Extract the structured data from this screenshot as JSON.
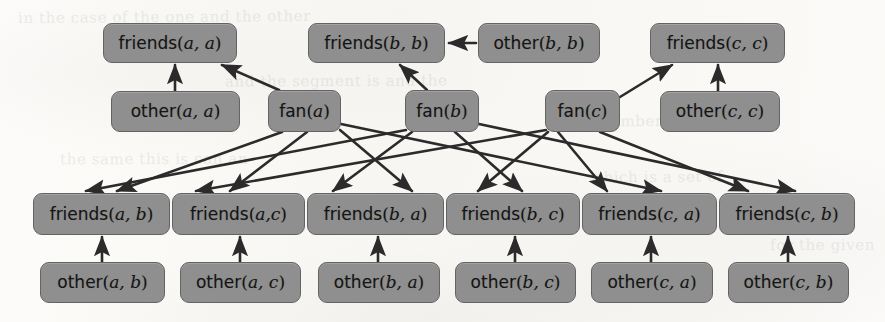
{
  "figure": {
    "colors": {
      "node_fill": "#8f8f8f",
      "node_border": "#636363",
      "edge": "#2b2b2b",
      "paper": "#faf9f7",
      "text": "#141414"
    },
    "constants": [
      "a",
      "b",
      "c"
    ],
    "predicates": [
      "friends",
      "other",
      "fan"
    ]
  },
  "nodes": [
    {
      "id": "friends_aa",
      "predicate": "friends",
      "args": "a, a",
      "label": "friends(a, a)",
      "x": 103,
      "y": 23,
      "w": 134,
      "h": 40
    },
    {
      "id": "friends_bb",
      "predicate": "friends",
      "args": "b, b",
      "label": "friends(b, b)",
      "x": 308,
      "y": 23,
      "w": 137,
      "h": 40
    },
    {
      "id": "other_bb",
      "predicate": "other",
      "args": "b, b",
      "label": "other(b, b)",
      "x": 478,
      "y": 23,
      "w": 122,
      "h": 40
    },
    {
      "id": "friends_cc",
      "predicate": "friends",
      "args": "c, c",
      "label": "friends(c, c)",
      "x": 650,
      "y": 23,
      "w": 135,
      "h": 40
    },
    {
      "id": "other_aa",
      "predicate": "other",
      "args": "a, a",
      "label": "other(a, a)",
      "x": 111,
      "y": 91,
      "w": 129,
      "h": 41
    },
    {
      "id": "fan_a",
      "predicate": "fan",
      "args": "a",
      "label": "fan(a)",
      "x": 268,
      "y": 90,
      "w": 73,
      "h": 42
    },
    {
      "id": "fan_b",
      "predicate": "fan",
      "args": "b",
      "label": "fan(b)",
      "x": 405,
      "y": 90,
      "w": 74,
      "h": 42
    },
    {
      "id": "fan_c",
      "predicate": "fan",
      "args": "c",
      "label": "fan(c)",
      "x": 545,
      "y": 90,
      "w": 75,
      "h": 42
    },
    {
      "id": "other_cc",
      "predicate": "other",
      "args": "c, c",
      "label": "other(c, c)",
      "x": 660,
      "y": 91,
      "w": 120,
      "h": 41
    },
    {
      "id": "friends_ab",
      "predicate": "friends",
      "args": "a, b",
      "label": "friends(a, b)",
      "x": 33,
      "y": 193,
      "w": 137,
      "h": 42
    },
    {
      "id": "friends_ac",
      "predicate": "friends",
      "args": "a,c",
      "label": "friends(a,c)",
      "x": 172,
      "y": 193,
      "w": 133,
      "h": 42
    },
    {
      "id": "friends_ba",
      "predicate": "friends",
      "args": "b, a",
      "label": "friends(b, a)",
      "x": 307,
      "y": 193,
      "w": 137,
      "h": 42
    },
    {
      "id": "friends_bc",
      "predicate": "friends",
      "args": "b, c",
      "label": "friends(b, c)",
      "x": 446,
      "y": 193,
      "w": 134,
      "h": 42
    },
    {
      "id": "friends_ca",
      "predicate": "friends",
      "args": "c, a",
      "label": "friends(c, a)",
      "x": 582,
      "y": 193,
      "w": 135,
      "h": 42
    },
    {
      "id": "friends_cb",
      "predicate": "friends",
      "args": "c, b",
      "label": "friends(c, b)",
      "x": 719,
      "y": 193,
      "w": 136,
      "h": 42
    },
    {
      "id": "other_ab",
      "predicate": "other",
      "args": "a, b",
      "label": "other(a, b)",
      "x": 40,
      "y": 262,
      "w": 125,
      "h": 41
    },
    {
      "id": "other_ac",
      "predicate": "other",
      "args": "a, c",
      "label": "other(a, c)",
      "x": 180,
      "y": 262,
      "w": 121,
      "h": 41
    },
    {
      "id": "other_ba",
      "predicate": "other",
      "args": "b, a",
      "label": "other(b, a)",
      "x": 318,
      "y": 262,
      "w": 122,
      "h": 41
    },
    {
      "id": "other_bc",
      "predicate": "other",
      "args": "b, c",
      "label": "other(b, c)",
      "x": 455,
      "y": 262,
      "w": 121,
      "h": 41
    },
    {
      "id": "other_ca",
      "predicate": "other",
      "args": "c, a",
      "label": "other(c, a)",
      "x": 591,
      "y": 262,
      "w": 122,
      "h": 41
    },
    {
      "id": "other_cb",
      "predicate": "other",
      "args": "c, b",
      "label": "other(c, b)",
      "x": 728,
      "y": 262,
      "w": 121,
      "h": 41
    }
  ],
  "edges": [
    {
      "from": "other_aa",
      "to": "friends_aa",
      "x1": 175,
      "y1": 91,
      "x2": 175,
      "y2": 65
    },
    {
      "from": "fan_a",
      "to": "friends_aa",
      "x1": 279,
      "y1": 90,
      "x2": 222,
      "y2": 65
    },
    {
      "from": "other_bb",
      "to": "friends_bb",
      "x1": 476,
      "y1": 43,
      "x2": 449,
      "y2": 43
    },
    {
      "from": "fan_b",
      "to": "friends_bb",
      "x1": 427,
      "y1": 90,
      "x2": 400,
      "y2": 65
    },
    {
      "from": "fan_c",
      "to": "friends_cc",
      "x1": 620,
      "y1": 97,
      "x2": 672,
      "y2": 65
    },
    {
      "from": "other_cc",
      "to": "friends_cc",
      "x1": 718,
      "y1": 91,
      "x2": 718,
      "y2": 65
    },
    {
      "from": "fan_a",
      "to": "friends_ab",
      "x1": 282,
      "y1": 132,
      "x2": 117,
      "y2": 191
    },
    {
      "from": "fan_a",
      "to": "friends_ac",
      "x1": 307,
      "y1": 132,
      "x2": 230,
      "y2": 191
    },
    {
      "from": "fan_b",
      "to": "friends_ba",
      "x1": 412,
      "y1": 132,
      "x2": 333,
      "y2": 191
    },
    {
      "from": "fan_b",
      "to": "friends_bc",
      "x1": 455,
      "y1": 132,
      "x2": 522,
      "y2": 191
    },
    {
      "from": "fan_c",
      "to": "friends_ca",
      "x1": 558,
      "y1": 132,
      "x2": 607,
      "y2": 191
    },
    {
      "from": "fan_c",
      "to": "friends_cb",
      "x1": 600,
      "y1": 132,
      "x2": 748,
      "y2": 191
    },
    {
      "from": "fan_b",
      "to": "friends_ab",
      "x1": 406,
      "y1": 130,
      "x2": 86,
      "y2": 191
    },
    {
      "from": "fan_c",
      "to": "friends_ac",
      "x1": 546,
      "y1": 130,
      "x2": 196,
      "y2": 191
    },
    {
      "from": "fan_a",
      "to": "friends_ba",
      "x1": 340,
      "y1": 130,
      "x2": 412,
      "y2": 191
    },
    {
      "from": "fan_a",
      "to": "friends_bc",
      "x1": 341,
      "y1": 124,
      "x2": 661,
      "y2": 191
    },
    {
      "from": "fan_b",
      "to": "friends_ca",
      "x1": 479,
      "y1": 124,
      "x2": 795,
      "y2": 191
    },
    {
      "from": "fan_c",
      "to": "friends_bc",
      "x1": 548,
      "y1": 132,
      "x2": 478,
      "y2": 191
    },
    {
      "from": "other_ab",
      "to": "friends_ab",
      "x1": 102,
      "y1": 262,
      "x2": 102,
      "y2": 237
    },
    {
      "from": "other_ac",
      "to": "friends_ac",
      "x1": 240,
      "y1": 262,
      "x2": 240,
      "y2": 237
    },
    {
      "from": "other_ba",
      "to": "friends_ba",
      "x1": 378,
      "y1": 262,
      "x2": 378,
      "y2": 237
    },
    {
      "from": "other_bc",
      "to": "friends_bc",
      "x1": 515,
      "y1": 262,
      "x2": 515,
      "y2": 237
    },
    {
      "from": "other_ca",
      "to": "friends_ca",
      "x1": 651,
      "y1": 262,
      "x2": 651,
      "y2": 237
    },
    {
      "from": "other_cb",
      "to": "friends_cb",
      "x1": 788,
      "y1": 262,
      "x2": 788,
      "y2": 237
    }
  ],
  "bleed_text": [
    {
      "text": "in the case of the one and the other",
      "x": 18,
      "y": 8,
      "rot": -0.4
    },
    {
      "text": "and the segment is  and  the",
      "x": 225,
      "y": 72,
      "rot": -0.3
    },
    {
      "text": "the same this is  can  an",
      "x": 60,
      "y": 150,
      "rot": -0.2
    },
    {
      "text": "number of  the  and",
      "x": 600,
      "y": 112,
      "rot": -0.3
    },
    {
      "text": "which is  a  set  of",
      "x": 590,
      "y": 168,
      "rot": -0.2
    },
    {
      "text": "for  the  given",
      "x": 770,
      "y": 236,
      "rot": -0.2
    }
  ]
}
